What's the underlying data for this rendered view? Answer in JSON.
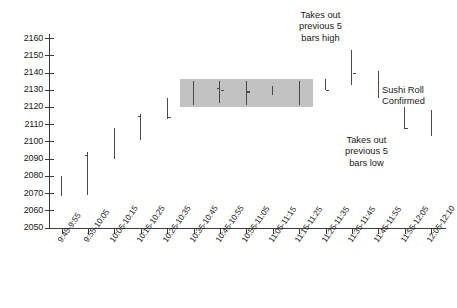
{
  "chart_data": {
    "type": "ohlc-bar",
    "title": "",
    "xlabel": "",
    "ylabel": "",
    "ylim": [
      2050,
      2160
    ],
    "y_ticks": [
      2050,
      2060,
      2070,
      2080,
      2090,
      2100,
      2110,
      2120,
      2130,
      2140,
      2150,
      2160
    ],
    "grid": false,
    "legend": "none",
    "categories": [
      "9:45-9:55",
      "9:55-10:05",
      "10:05-10:15",
      "10:15-10:25",
      "10:25-10:35",
      "10:35-10:45",
      "10:45-10:55",
      "10:55-11:05",
      "11:05-11:15",
      "11:15-11:25",
      "11:25-11:35",
      "11:35-11:45",
      "11:45-11:55",
      "11:55-12:05",
      "12:05-12:10"
    ],
    "bars": [
      {
        "label": "9:45-9:55",
        "high": 2080,
        "low": 2068,
        "open": null,
        "close": null,
        "in_pattern": false
      },
      {
        "label": "9:55-10:05",
        "high": 2094,
        "low": 2069,
        "open": 2092,
        "close": null,
        "in_pattern": false
      },
      {
        "label": "10:05-10:15",
        "high": 2108,
        "low": 2090,
        "open": null,
        "close": null,
        "in_pattern": false
      },
      {
        "label": "10:15-10:25",
        "high": 2116,
        "low": 2101,
        "open": 2115,
        "close": null,
        "in_pattern": false
      },
      {
        "label": "10:25-10:35",
        "high": 2125,
        "low": 2113,
        "open": null,
        "close": 2114,
        "in_pattern": false
      },
      {
        "label": "10:35-10:45",
        "high": 2135,
        "low": 2121,
        "open": null,
        "close": null,
        "in_pattern": true
      },
      {
        "label": "10:45-10:55",
        "high": 2135,
        "low": 2122,
        "open": 2131,
        "close": 2130,
        "in_pattern": true
      },
      {
        "label": "10:55-11:05",
        "high": 2135,
        "low": 2121,
        "open": null,
        "close": 2129,
        "in_pattern": true
      },
      {
        "label": "11:05-11:15",
        "high": 2132,
        "low": 2127,
        "open": null,
        "close": null,
        "in_pattern": true
      },
      {
        "label": "11:15-11:25",
        "high": 2135,
        "low": 2121,
        "open": null,
        "close": null,
        "in_pattern": true
      },
      {
        "label": "11:25-11:35",
        "high": 2136,
        "low": 2130,
        "open": null,
        "close": 2130,
        "in_pattern": false
      },
      {
        "label": "11:35-11:45",
        "high": 2153,
        "low": 2133,
        "open": null,
        "close": 2140,
        "in_pattern": false
      },
      {
        "label": "11:45-11:55",
        "high": 2141,
        "low": 2125,
        "open": null,
        "close": null,
        "in_pattern": false
      },
      {
        "label": "11:55-12:05",
        "high": 2120,
        "low": 2107,
        "open": null,
        "close": 2108,
        "in_pattern": false
      },
      {
        "label": "12:05-12:10",
        "high": 2118,
        "low": 2103,
        "open": null,
        "close": null,
        "in_pattern": false
      }
    ],
    "highlight_region": {
      "label": "sushi-roll-pattern-box",
      "from_category": "10:35-10:45",
      "to_category": "11:15-11:25",
      "y_top": 2135,
      "y_bottom": 2121,
      "color": "#c2c2c2"
    },
    "annotations": [
      {
        "id": "takes-out-previous-5-bars-high",
        "lines": [
          "Takes out",
          "previous 5",
          "bars high"
        ],
        "target_category": "11:35-11:45",
        "placement": "above"
      },
      {
        "id": "takes-out-previous-5-bars-low",
        "lines": [
          "Takes out",
          "previous 5",
          "bars low"
        ],
        "target_category": "11:55-12:05",
        "placement": "below"
      },
      {
        "id": "sushi-roll-confirmed",
        "lines": [
          "Sushi Roll",
          "Confirmed"
        ],
        "target_category": "12:05-12:10",
        "placement": "above-right"
      }
    ],
    "colors": {
      "bar": "#4a4a4a",
      "axis": "#3a3a3a",
      "highlight": "#c2c2c2",
      "text": "#1a1a1a",
      "background": "#ffffff"
    }
  }
}
